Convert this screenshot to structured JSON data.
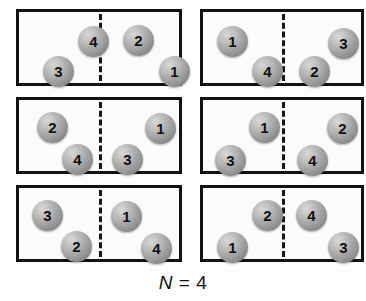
{
  "figure": {
    "caption": {
      "symbol": "N",
      "relation": " = ",
      "value": "4",
      "full": "N = 4"
    },
    "layout": {
      "columns": 2,
      "rows": 3,
      "box_count": 6,
      "divider_style": "dashed",
      "box_border_color": "#121212",
      "ball_fill_color": "#a0a0a0",
      "background_color": "#fdfdfd"
    },
    "boxes": [
      {
        "id": "box-1",
        "row": 1,
        "column": 1,
        "x": 16,
        "y": 9,
        "width": 166,
        "height": 77,
        "left_cell_count": 2,
        "right_cell_count": 2,
        "left_cell_labels": "4, 3",
        "right_cell_labels": "2, 1",
        "balls": [
          {
            "label": "4",
            "side": "left",
            "x": 59,
            "y": 14
          },
          {
            "label": "3",
            "side": "left",
            "x": 24,
            "y": 44
          },
          {
            "label": "2",
            "side": "right",
            "x": 104,
            "y": 13
          },
          {
            "label": "1",
            "side": "right",
            "x": 140,
            "y": 44
          }
        ]
      },
      {
        "id": "box-2",
        "row": 1,
        "column": 2,
        "x": 200,
        "y": 9,
        "width": 164,
        "height": 77,
        "left_cell_count": 2,
        "right_cell_count": 2,
        "left_cell_labels": "1, 4",
        "right_cell_labels": "3, 2",
        "balls": [
          {
            "label": "1",
            "side": "left",
            "x": 14,
            "y": 14
          },
          {
            "label": "4",
            "side": "left",
            "x": 49,
            "y": 44
          },
          {
            "label": "3",
            "side": "right",
            "x": 125,
            "y": 16
          },
          {
            "label": "2",
            "side": "right",
            "x": 96,
            "y": 44
          }
        ]
      },
      {
        "id": "box-3",
        "row": 2,
        "column": 1,
        "x": 16,
        "y": 97,
        "width": 166,
        "height": 77,
        "left_cell_count": 2,
        "right_cell_count": 2,
        "left_cell_labels": "2, 4",
        "right_cell_labels": "1, 3",
        "balls": [
          {
            "label": "2",
            "side": "left",
            "x": 18,
            "y": 12
          },
          {
            "label": "4",
            "side": "left",
            "x": 43,
            "y": 44
          },
          {
            "label": "1",
            "side": "right",
            "x": 126,
            "y": 13
          },
          {
            "label": "3",
            "side": "right",
            "x": 93,
            "y": 44
          }
        ]
      },
      {
        "id": "box-4",
        "row": 2,
        "column": 2,
        "x": 200,
        "y": 97,
        "width": 164,
        "height": 77,
        "left_cell_count": 2,
        "right_cell_count": 2,
        "left_cell_labels": "1, 3",
        "right_cell_labels": "2, 4",
        "balls": [
          {
            "label": "1",
            "side": "left",
            "x": 46,
            "y": 12
          },
          {
            "label": "3",
            "side": "left",
            "x": 12,
            "y": 45
          },
          {
            "label": "2",
            "side": "right",
            "x": 124,
            "y": 13
          },
          {
            "label": "4",
            "side": "right",
            "x": 94,
            "y": 45
          }
        ]
      },
      {
        "id": "box-5",
        "row": 3,
        "column": 1,
        "x": 16,
        "y": 185,
        "width": 166,
        "height": 77,
        "left_cell_count": 2,
        "right_cell_count": 2,
        "left_cell_labels": "3, 2",
        "right_cell_labels": "1, 4",
        "balls": [
          {
            "label": "3",
            "side": "left",
            "x": 13,
            "y": 12
          },
          {
            "label": "2",
            "side": "left",
            "x": 42,
            "y": 43
          },
          {
            "label": "1",
            "side": "right",
            "x": 92,
            "y": 13
          },
          {
            "label": "4",
            "side": "right",
            "x": 122,
            "y": 45
          }
        ]
      },
      {
        "id": "box-6",
        "row": 3,
        "column": 2,
        "x": 200,
        "y": 185,
        "width": 164,
        "height": 77,
        "left_cell_count": 2,
        "right_cell_count": 2,
        "left_cell_labels": "2, 1",
        "right_cell_labels": "4, 3",
        "balls": [
          {
            "label": "2",
            "side": "left",
            "x": 49,
            "y": 12
          },
          {
            "label": "1",
            "side": "left",
            "x": 14,
            "y": 44
          },
          {
            "label": "4",
            "side": "right",
            "x": 93,
            "y": 12
          },
          {
            "label": "3",
            "side": "right",
            "x": 125,
            "y": 44
          }
        ]
      }
    ]
  }
}
